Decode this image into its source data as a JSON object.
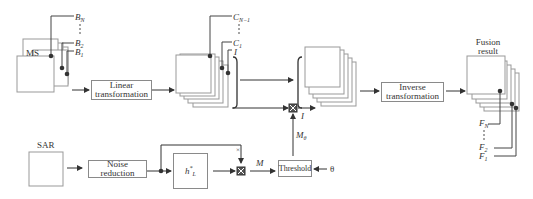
{
  "inputs": {
    "ms_label": "MS",
    "sar_label": "SAR",
    "ms_bands": {
      "top": "B",
      "top_sub": "N",
      "b2": "B",
      "b2_sub": "2",
      "b1": "B",
      "b1_sub": "1"
    }
  },
  "blocks": {
    "linear_line1": "Linear",
    "linear_line2": "transformation",
    "noise_line1": "Noise",
    "noise_line2": "reduction",
    "hl_symbol": "h",
    "hl_sub": "L",
    "hl_sup": "*",
    "threshold": "Threshold",
    "inverse_line1": "Inverse",
    "inverse_line2": "transformation"
  },
  "components": {
    "c_top": "C",
    "c_top_sub": "N−1",
    "c1": "C",
    "c1_sub": "1",
    "i_label": "I",
    "i_out": "I"
  },
  "signals": {
    "m": "M",
    "m_theta": "M",
    "m_theta_sub": "θ",
    "theta": "θ",
    "times": "×"
  },
  "output": {
    "title_line1": "Fusion",
    "title_line2": "result",
    "fn": "F",
    "fn_sub": "N",
    "f2": "F",
    "f2_sub": "2",
    "f1": "F",
    "f1_sub": "1"
  },
  "colors": {
    "line": "#444444",
    "box_border": "#8a8a8a"
  }
}
